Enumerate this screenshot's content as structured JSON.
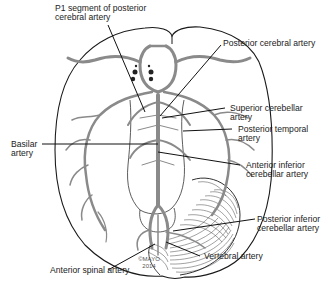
{
  "figure": {
    "copyright_line1": "©MAYO",
    "copyright_line2": "2014",
    "colors": {
      "outline": "#1a1a1a",
      "artery": "#8a8a8a",
      "leader": "#111111",
      "background": "#ffffff"
    }
  },
  "labels": {
    "p1_line1": "P1 segment of posterior",
    "p1_line2": "cerebral artery",
    "pca": "Posterior cerebral artery",
    "sca_line1": "Superior cerebellar",
    "sca_line2": "artery",
    "pta_line1": "Posterior temporal",
    "pta_line2": "artery",
    "basilar_line1": "Basilar",
    "basilar_line2": "artery",
    "aica_line1": "Anterior inferior",
    "aica_line2": "cerebellar artery",
    "pica_line1": "Posterior inferior",
    "pica_line2": "cerebellar artery",
    "vertebral": "Vertebral artery",
    "asa": "Anterior spinal artery"
  }
}
